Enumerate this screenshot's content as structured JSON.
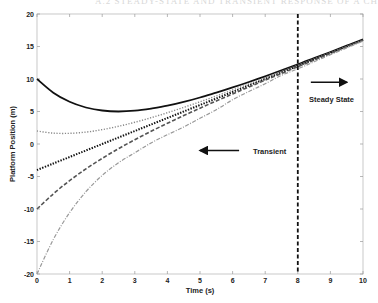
{
  "header": {
    "partial_text": "A.2 STEADY-STATE AND TRANSIENT RESPONSE OF A CHAR"
  },
  "chart_data": {
    "type": "line",
    "title": "",
    "xlabel": "Time (s)",
    "ylabel": "Platform Position (m)",
    "xlim": [
      0,
      10
    ],
    "ylim": [
      -20,
      20
    ],
    "xticks": [
      0,
      1,
      2,
      3,
      4,
      5,
      6,
      7,
      8,
      9,
      10
    ],
    "yticks": [
      -20,
      -15,
      -10,
      -5,
      0,
      5,
      10,
      15,
      20
    ],
    "grid": false,
    "legend": null,
    "x": [
      0,
      0.5,
      1,
      1.5,
      2,
      2.5,
      3,
      3.5,
      4,
      4.5,
      5,
      5.5,
      6,
      6.5,
      7,
      7.5,
      8,
      8.5,
      9,
      9.5,
      10
    ],
    "series": [
      {
        "name": "y0 = 10",
        "style": "solid",
        "color": "#111111",
        "values": [
          10.0,
          7.9,
          6.49,
          5.62,
          5.15,
          5.0,
          5.12,
          5.45,
          5.89,
          6.47,
          7.15,
          7.9,
          8.7,
          9.54,
          10.42,
          11.33,
          12.26,
          13.2,
          14.16,
          15.12,
          16.09
        ]
      },
      {
        "name": "y0 = 2",
        "style": "dotted",
        "color": "#888888",
        "values": [
          2.0,
          1.67,
          1.64,
          1.83,
          2.21,
          2.72,
          3.34,
          4.04,
          4.81,
          5.63,
          6.49,
          7.38,
          8.3,
          9.23,
          10.18,
          11.14,
          12.11,
          13.09,
          14.07,
          15.05,
          16.04
        ]
      },
      {
        "name": "y0 = -4",
        "style": "dotted-bold",
        "color": "#111111",
        "values": [
          -4.0,
          -3.0,
          -2.0,
          -1.0,
          0.0,
          1.0,
          2.0,
          3.0,
          4.0,
          5.0,
          6.0,
          7.0,
          8.0,
          9.0,
          10.0,
          11.0,
          12.0,
          13.0,
          14.0,
          15.0,
          16.0
        ]
      },
      {
        "name": "y0 = -10",
        "style": "dashed",
        "color": "#555555",
        "values": [
          -10.0,
          -7.67,
          -5.64,
          -3.83,
          -2.21,
          -0.72,
          0.66,
          1.96,
          3.19,
          4.37,
          5.51,
          6.62,
          7.7,
          8.77,
          9.82,
          10.86,
          11.89,
          12.91,
          13.93,
          14.95,
          15.96
        ]
      },
      {
        "name": "y0 = -20",
        "style": "dash-dot",
        "color": "#999999",
        "values": [
          -20.0,
          -14.69,
          -10.56,
          -7.34,
          -4.83,
          -2.88,
          -1.36,
          0.17,
          1.43,
          2.62,
          3.96,
          5.27,
          6.81,
          8.08,
          9.27,
          10.57,
          11.56,
          12.65,
          13.73,
          14.79,
          15.84
        ]
      }
    ],
    "annotations": [
      {
        "type": "vline",
        "x": 8,
        "style": "dashed",
        "color": "#111111"
      },
      {
        "type": "arrow",
        "direction": "right",
        "from": [
          8.4,
          9.5
        ],
        "to": [
          9.5,
          9.5
        ]
      },
      {
        "type": "text",
        "text": "Steady State",
        "x": 8.4,
        "y": 7.3
      },
      {
        "type": "arrow",
        "direction": "left",
        "from": [
          6.2,
          -1
        ],
        "to": [
          5.0,
          -1
        ]
      },
      {
        "type": "text",
        "text": "Transient",
        "x": 6.9,
        "y": -1
      }
    ]
  },
  "labels": {
    "steady_state": "Steady State",
    "transient": "Transient",
    "xlabel": "Time (s)",
    "ylabel": "Platform Position (m)"
  }
}
